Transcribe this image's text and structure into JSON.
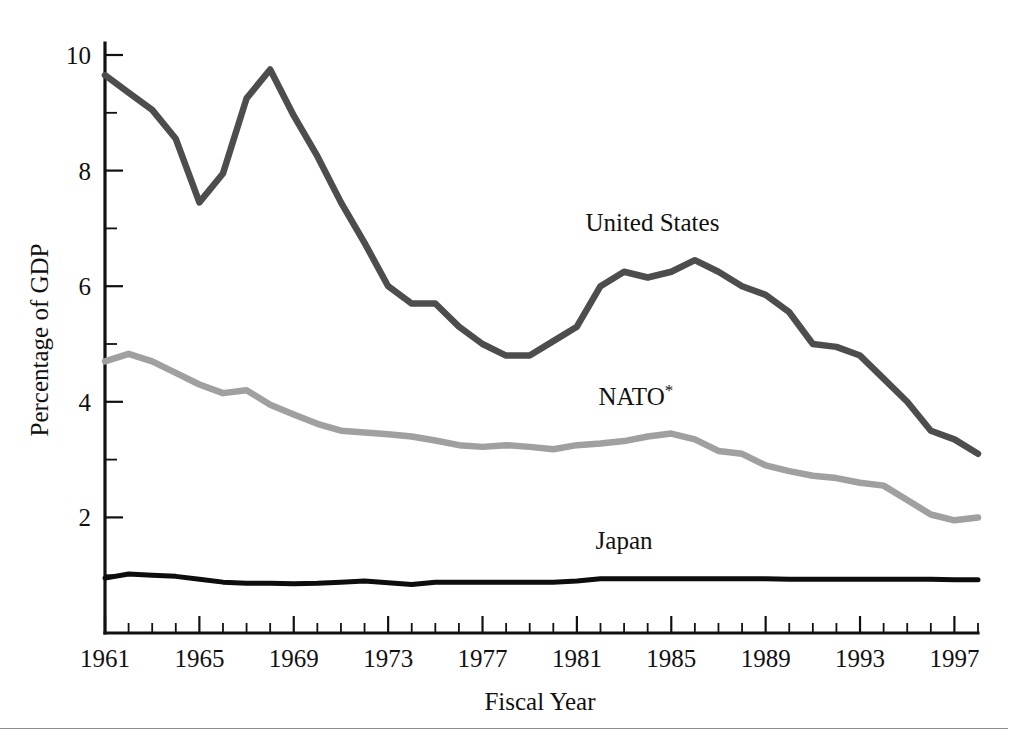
{
  "chart_data": {
    "type": "line",
    "title": "",
    "xlabel": "Fiscal Year",
    "ylabel": "Percentage of GDP",
    "xlim": [
      1961,
      1998
    ],
    "ylim": [
      0,
      10.6
    ],
    "grid": false,
    "legend_position": "inline-annotations",
    "x": [
      1961,
      1962,
      1963,
      1964,
      1965,
      1966,
      1967,
      1968,
      1969,
      1970,
      1971,
      1972,
      1973,
      1974,
      1975,
      1976,
      1977,
      1978,
      1979,
      1980,
      1981,
      1982,
      1983,
      1984,
      1985,
      1986,
      1987,
      1988,
      1989,
      1990,
      1991,
      1992,
      1993,
      1994,
      1995,
      1996,
      1997,
      1998
    ],
    "x_tick_labels": [
      "1961",
      "1965",
      "1969",
      "1973",
      "1977",
      "1981",
      "1985",
      "1989",
      "1993",
      "1997"
    ],
    "x_tick_values": [
      1961,
      1965,
      1969,
      1973,
      1977,
      1981,
      1985,
      1989,
      1993,
      1997
    ],
    "y_tick_labels": [
      "2",
      "4",
      "6",
      "8",
      "10"
    ],
    "y_tick_values": [
      2,
      4,
      6,
      8,
      10
    ],
    "y_minor_tick_values": [
      1,
      3,
      5,
      7,
      9
    ],
    "series": [
      {
        "name": "United States",
        "color": "#4d4d4d",
        "label_x": 1984.2,
        "label_y": 6.95,
        "values": [
          9.65,
          9.35,
          9.05,
          8.55,
          7.45,
          7.95,
          9.25,
          9.75,
          8.95,
          8.25,
          7.45,
          6.75,
          6.0,
          5.7,
          5.7,
          5.3,
          5.0,
          4.8,
          4.8,
          5.05,
          5.3,
          6.0,
          6.25,
          6.15,
          6.25,
          6.45,
          6.25,
          6.0,
          5.85,
          5.55,
          5.0,
          4.95,
          4.8,
          4.4,
          4.0,
          3.5,
          3.35,
          3.1
        ]
      },
      {
        "name": "NATO",
        "name_suffix": "*",
        "color": "#a0a0a0",
        "label_x": 1983.5,
        "label_y": 3.95,
        "values": [
          4.7,
          4.83,
          4.7,
          4.5,
          4.3,
          4.15,
          4.2,
          3.95,
          3.78,
          3.62,
          3.5,
          3.47,
          3.44,
          3.4,
          3.33,
          3.25,
          3.22,
          3.25,
          3.22,
          3.18,
          3.25,
          3.28,
          3.32,
          3.4,
          3.45,
          3.35,
          3.15,
          3.1,
          2.9,
          2.8,
          2.72,
          2.68,
          2.6,
          2.55,
          2.3,
          2.05,
          1.95,
          2.0
        ]
      },
      {
        "name": "Japan",
        "color": "#0d0d0d",
        "label_x": 1983.0,
        "label_y": 1.45,
        "values": [
          0.95,
          1.02,
          1.0,
          0.98,
          0.93,
          0.88,
          0.86,
          0.86,
          0.85,
          0.86,
          0.88,
          0.9,
          0.87,
          0.84,
          0.88,
          0.88,
          0.88,
          0.88,
          0.88,
          0.88,
          0.9,
          0.94,
          0.94,
          0.94,
          0.94,
          0.94,
          0.94,
          0.94,
          0.94,
          0.93,
          0.93,
          0.93,
          0.93,
          0.93,
          0.93,
          0.93,
          0.92,
          0.92
        ]
      }
    ]
  },
  "figure": {
    "y_axis_title": "Percentage of GDP",
    "x_axis_title": "Fiscal Year",
    "labels": {
      "united_states": "United States",
      "nato": "NATO",
      "nato_footnote_marker": "*",
      "japan": "Japan"
    },
    "y_ticks": [
      "10",
      "8",
      "6",
      "4",
      "2"
    ],
    "x_ticks": [
      "1961",
      "1965",
      "1969",
      "1973",
      "1977",
      "1981",
      "1985",
      "1989",
      "1993",
      "1997"
    ]
  }
}
